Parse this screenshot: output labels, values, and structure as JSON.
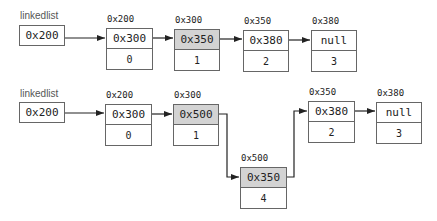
{
  "diagrams": [
    {
      "id": "original",
      "head": {
        "label": "linkedlist",
        "pointer": "0x200"
      },
      "nodes": [
        {
          "address": "0x200",
          "next": "0x300",
          "value": "0",
          "highlighted": false
        },
        {
          "address": "0x300",
          "next": "0x350",
          "value": "1",
          "highlighted": true
        },
        {
          "address": "0x350",
          "next": "0x380",
          "value": "2",
          "highlighted": false
        },
        {
          "address": "0x380",
          "next": "null",
          "value": "3",
          "highlighted": false
        }
      ]
    },
    {
      "id": "after-insert",
      "head": {
        "label": "linkedlist",
        "pointer": "0x200"
      },
      "nodes": [
        {
          "address": "0x200",
          "next": "0x300",
          "value": "0",
          "highlighted": false
        },
        {
          "address": "0x300",
          "next": "0x500",
          "value": "1",
          "highlighted": true
        },
        {
          "address": "0x500",
          "next": "0x350",
          "value": "4",
          "highlighted": true
        },
        {
          "address": "0x350",
          "next": "0x380",
          "value": "2",
          "highlighted": false
        },
        {
          "address": "0x380",
          "next": "null",
          "value": "3",
          "highlighted": false
        }
      ]
    }
  ],
  "colors": {
    "highlight": "#d3d3d3",
    "border": "#666666",
    "arrow": "#222222"
  }
}
